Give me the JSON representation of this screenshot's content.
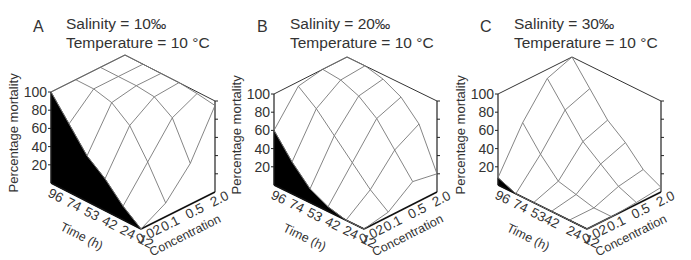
{
  "chart_data": [
    {
      "type": "surface3d",
      "panel_label": "A",
      "title_lines": [
        "Salinity = 10‰",
        "Temperature = 10 °C"
      ],
      "zlabel": "Percentage mortality",
      "xlabel": "Time (h)",
      "ylabel": "Concentration",
      "z_ticks": [
        "100",
        "80",
        "60",
        "40",
        "20"
      ],
      "x_ticks": [
        "96",
        "74",
        "53",
        "42",
        "24",
        "12"
      ],
      "y_ticks": [
        "0.02",
        "0.1",
        "0.5",
        "2.0"
      ],
      "zlim": [
        0,
        100
      ],
      "time": [
        96,
        74,
        53,
        42,
        24,
        12
      ],
      "concentration": [
        0.02,
        0.1,
        0.5,
        2.0
      ],
      "mortality": [
        [
          100,
          100,
          100,
          100
        ],
        [
          75,
          100,
          100,
          100
        ],
        [
          50,
          95,
          100,
          100
        ],
        [
          35,
          80,
          98,
          100
        ],
        [
          15,
          50,
          85,
          98
        ],
        [
          0,
          15,
          45,
          95
        ]
      ]
    },
    {
      "type": "surface3d",
      "panel_label": "B",
      "title_lines": [
        "Salinity = 20‰",
        "Temperature = 10 °C"
      ],
      "zlabel": "Percentage mortality",
      "xlabel": "Time (h)",
      "ylabel": "Concentration",
      "z_ticks": [
        "100",
        "80",
        "60",
        "40",
        "20"
      ],
      "x_ticks": [
        "96",
        "74",
        "53",
        "42",
        "24",
        "12"
      ],
      "y_ticks": [
        "0.02",
        "0.1",
        "0.5",
        "2.0"
      ],
      "zlim": [
        0,
        100
      ],
      "time": [
        96,
        74,
        53,
        42,
        24,
        12
      ],
      "concentration": [
        0.02,
        0.1,
        0.5,
        2.0
      ],
      "mortality": [
        [
          60,
          95,
          100,
          100
        ],
        [
          35,
          80,
          98,
          100
        ],
        [
          15,
          60,
          90,
          95
        ],
        [
          5,
          40,
          75,
          85
        ],
        [
          0,
          20,
          50,
          65
        ],
        [
          0,
          5,
          25,
          20
        ]
      ]
    },
    {
      "type": "surface3d",
      "panel_label": "C",
      "title_lines": [
        "Salinity = 30‰",
        "Temperature = 10 °C"
      ],
      "zlabel": "Percentage mortality",
      "xlabel": "Time (h)",
      "ylabel": "Concentration",
      "z_ticks": [
        "100",
        "80",
        "60",
        "40",
        "20"
      ],
      "x_ticks": [
        "96",
        "74",
        "5342",
        "",
        "24",
        "12"
      ],
      "y_ticks": [
        "0.02",
        "0.1",
        "0.5",
        "2.0"
      ],
      "zlim": [
        0,
        100
      ],
      "time": [
        96,
        74,
        53,
        42,
        24,
        12
      ],
      "concentration": [
        0.02,
        0.1,
        0.5,
        2.0
      ],
      "mortality": [
        [
          8,
          55,
          90,
          100
        ],
        [
          0,
          30,
          65,
          75
        ],
        [
          0,
          10,
          40,
          50
        ],
        [
          0,
          5,
          25,
          35
        ],
        [
          0,
          0,
          10,
          15
        ],
        [
          0,
          0,
          2,
          5
        ]
      ]
    }
  ]
}
